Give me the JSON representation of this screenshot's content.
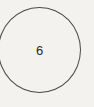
{
  "diagram": {
    "node": {
      "label": "6",
      "shape": "circle",
      "stroke_color": "#4a4a4a",
      "background_color": "#f3f2ef"
    }
  }
}
